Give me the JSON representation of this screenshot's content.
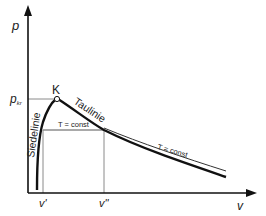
{
  "diagram": {
    "type": "p-v phase diagram",
    "axes": {
      "y_label": "p",
      "x_label": "v"
    },
    "critical_point": {
      "label": "K",
      "pressure_label": "p",
      "pressure_sub": "kr"
    },
    "curves": {
      "saturated_liquid": "Siedelinie",
      "saturated_vapor": "Taulinie",
      "isotherm_inside": "T = const",
      "isotherm_outside": "T = const"
    },
    "ticks": {
      "v_liquid": "v'",
      "v_vapor": "v''"
    },
    "colors": {
      "curve": "#111111",
      "axis": "#111111",
      "guide": "#888888"
    }
  }
}
